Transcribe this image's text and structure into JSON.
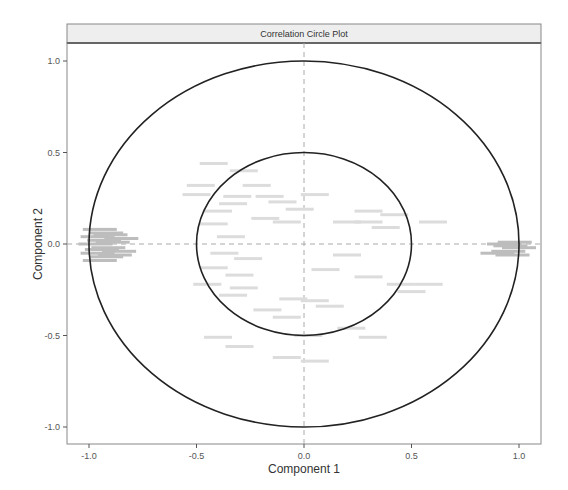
{
  "chart_data": {
    "type": "scatter",
    "title": "Correlation Circle Plot",
    "xlabel": "Component  1",
    "ylabel": "Component  2",
    "xlim": [
      -1.1,
      1.1
    ],
    "ylim": [
      -1.1,
      1.1
    ],
    "x_ticks": [
      "-1.0",
      "-0.5",
      "0.0",
      "0.5",
      "1.0"
    ],
    "y_ticks": [
      "-1.0",
      "-0.5",
      "0.0",
      "0.5",
      "1.0"
    ],
    "grid": false,
    "reference_lines": {
      "x": 0,
      "y": 0,
      "style": "dashed"
    },
    "circles": [
      {
        "name": "outer",
        "radius": 1.0
      },
      {
        "name": "inner",
        "radius": 0.5
      }
    ],
    "legend": null,
    "variable_label_clusters": [
      {
        "region": "left-dense",
        "x_range": [
          -1.05,
          -0.8
        ],
        "y_range": [
          -0.1,
          0.1
        ],
        "approx_count": 40
      },
      {
        "region": "right-dense",
        "x_range": [
          0.85,
          1.05
        ],
        "y_range": [
          -0.07,
          0.02
        ],
        "approx_count": 15
      },
      {
        "region": "inner-scattered",
        "x_range": [
          -0.6,
          0.6
        ],
        "y_range": [
          -0.6,
          0.5
        ],
        "approx_count": 50
      }
    ],
    "points": [
      [
        -0.42,
        0.44
      ],
      [
        -0.28,
        0.4
      ],
      [
        -0.48,
        0.32
      ],
      [
        -0.22,
        0.32
      ],
      [
        -0.5,
        0.27
      ],
      [
        -0.31,
        0.26
      ],
      [
        -0.16,
        0.26
      ],
      [
        0.05,
        0.27
      ],
      [
        -0.1,
        0.23
      ],
      [
        -0.02,
        0.19
      ],
      [
        -0.33,
        0.22
      ],
      [
        -0.4,
        0.18
      ],
      [
        -0.18,
        0.14
      ],
      [
        -0.42,
        0.11
      ],
      [
        -0.34,
        0.04
      ],
      [
        -0.08,
        0.12
      ],
      [
        0.3,
        0.18
      ],
      [
        0.2,
        0.12
      ],
      [
        0.3,
        0.12
      ],
      [
        0.38,
        0.09
      ],
      [
        0.42,
        0.16
      ],
      [
        0.6,
        0.12
      ],
      [
        -0.37,
        -0.05
      ],
      [
        -0.26,
        -0.08
      ],
      [
        -0.42,
        -0.13
      ],
      [
        -0.3,
        -0.17
      ],
      [
        -0.45,
        -0.22
      ],
      [
        -0.28,
        -0.24
      ],
      [
        -0.33,
        -0.28
      ],
      [
        0.2,
        -0.06
      ],
      [
        0.1,
        -0.14
      ],
      [
        0.3,
        -0.18
      ],
      [
        0.45,
        -0.22
      ],
      [
        0.58,
        -0.22
      ],
      [
        0.5,
        -0.26
      ],
      [
        -0.05,
        -0.3
      ],
      [
        0.05,
        -0.31
      ],
      [
        0.12,
        -0.34
      ],
      [
        -0.17,
        -0.36
      ],
      [
        -0.08,
        -0.4
      ],
      [
        0.22,
        -0.46
      ],
      [
        0.32,
        -0.51
      ],
      [
        0.02,
        -0.5
      ],
      [
        -0.4,
        -0.51
      ],
      [
        -0.3,
        -0.56
      ],
      [
        -0.08,
        -0.62
      ],
      [
        0.05,
        -0.64
      ],
      [
        -0.95,
        0.08
      ],
      [
        -0.92,
        0.06
      ],
      [
        -0.96,
        0.04
      ],
      [
        -0.93,
        0.02
      ],
      [
        -0.97,
        0.0
      ],
      [
        -0.94,
        -0.03
      ],
      [
        -0.96,
        -0.05
      ],
      [
        -0.92,
        -0.07
      ],
      [
        -0.95,
        -0.09
      ],
      [
        -0.9,
        0.05
      ],
      [
        -0.89,
        0.01
      ],
      [
        -0.91,
        -0.02
      ],
      [
        -0.88,
        -0.06
      ],
      [
        -0.85,
        0.03
      ],
      [
        -0.86,
        -0.04
      ],
      [
        0.93,
        0.0
      ],
      [
        0.96,
        -0.01
      ],
      [
        0.98,
        0.01
      ],
      [
        0.95,
        -0.04
      ],
      [
        1.0,
        -0.02
      ],
      [
        0.9,
        -0.05
      ],
      [
        0.97,
        -0.06
      ]
    ]
  },
  "strip": {
    "title": "Correlation Circle Plot"
  },
  "axes": {
    "x_label": "Component  1",
    "y_label": "Component  2",
    "x_ticks": [
      "-1.0",
      "-0.5",
      "0.0",
      "0.5",
      "1.0"
    ],
    "y_ticks": [
      "1.0",
      "0.5",
      "0.0",
      "-0.5",
      "-1.0"
    ]
  }
}
